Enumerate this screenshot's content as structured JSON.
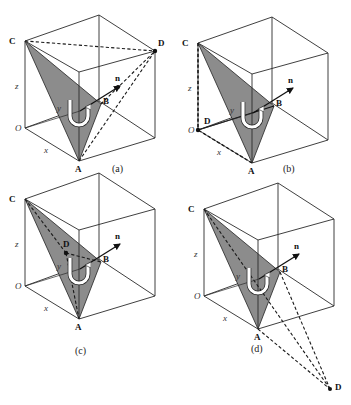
{
  "figure": {
    "panels": [
      {
        "id": "a",
        "caption": "(a)",
        "dx": 0,
        "dy": 0,
        "d_position": "top-right-front corner of cube",
        "d_point": [
          155,
          51
        ]
      },
      {
        "id": "b",
        "caption": "(b)",
        "dx": 173,
        "dy": 2,
        "d_position": "coincides with origin O",
        "d_point": [
          25,
          128
        ]
      },
      {
        "id": "c",
        "caption": "(c)",
        "dx": 0,
        "dy": 158,
        "d_position": "inside triangle ABC",
        "d_point": [
          66,
          95
        ]
      },
      {
        "id": "d",
        "caption": "(d)",
        "dx": 179,
        "dy": 168,
        "d_position": "outside cube, below",
        "d_point": [
          151,
          221
        ]
      }
    ],
    "labels": {
      "C": "C",
      "A": "A",
      "B": "B",
      "D": "D",
      "O": "O",
      "n": "n",
      "x": "x",
      "y": "y",
      "z": "z"
    },
    "colors": {
      "triangle_fill": "#8c8c8c",
      "edges": "#2a2a2a",
      "background": "#ffffff"
    }
  }
}
